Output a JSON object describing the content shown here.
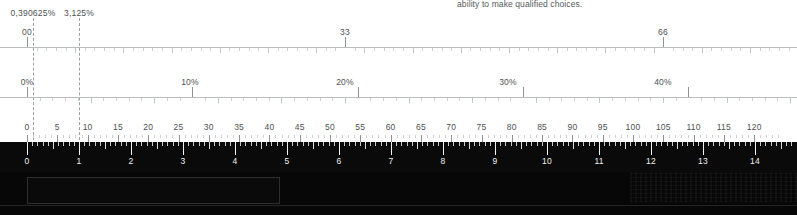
{
  "document": {
    "paragraph_text": "ability to make qualified choices."
  },
  "rulers": {
    "fraction_ruler": {
      "name": "fraction-scale",
      "labels": [
        "00",
        "33",
        "66"
      ],
      "label_positions": [
        27,
        345,
        663
      ],
      "axis_y": 47,
      "tick_start": 27,
      "tick_step": 9.64,
      "tick_count": 80,
      "major_every": 33,
      "guides": [
        {
          "label": "0,390625%",
          "x": 33
        },
        {
          "label": "3,125%",
          "x": 79
        }
      ]
    },
    "percent_ruler": {
      "name": "percent-scale",
      "labels": [
        "0%",
        "10%",
        "20%",
        "30%",
        "40%"
      ],
      "label_positions": [
        27,
        190,
        345,
        508,
        663
      ],
      "axis_y": 97,
      "tick_start": 27,
      "tick_step": 12.72,
      "tick_count": 61,
      "major_every": 13
    },
    "numeric_ruler": {
      "name": "numeric-scale",
      "labels": [
        "0",
        "5",
        "10",
        "15",
        "20",
        "25",
        "30",
        "35",
        "40",
        "45",
        "50",
        "55",
        "60",
        "65",
        "70",
        "75",
        "80",
        "85",
        "90",
        "95",
        "100",
        "105",
        "110",
        "115",
        "120"
      ],
      "label_y": 124,
      "axis_y": 135,
      "tick_start": 27,
      "tick_step": 6.06,
      "tick_count": 125,
      "major_every": 5
    },
    "dark_ruler": {
      "name": "inverted-scale",
      "labels": [
        "0",
        "1",
        "2",
        "3",
        "4",
        "5",
        "6",
        "7",
        "8",
        "9",
        "10",
        "11",
        "12",
        "13",
        "14"
      ],
      "tick_start": 27,
      "unit_step": 52,
      "subdivisions": 10,
      "units": 15
    }
  },
  "panel": {
    "input_value": "",
    "input_placeholder": ""
  },
  "colors": {
    "page_background": "#ffffff",
    "ruler_line": "#b9bdc0",
    "label_text": "#4d5154",
    "body_text": "#555a5e",
    "guide_dash": "#9aa0a4",
    "dark_background": "#0a0a0a",
    "dark_tick": "#f2f2f2",
    "dark_label": "#f0f0f0",
    "input_border": "#2e2e2e"
  }
}
